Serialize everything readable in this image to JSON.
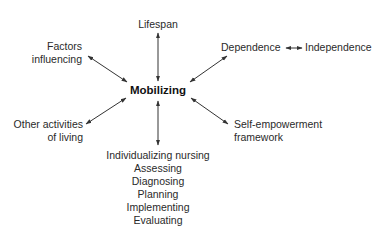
{
  "diagram": {
    "center": "Mobilizing",
    "nodes": {
      "top": "Lifespan",
      "top_left": [
        "Factors",
        "influencing"
      ],
      "top_right_a": "Dependence",
      "top_right_b": "Independence",
      "bottom_left": [
        "Other activities",
        "of living"
      ],
      "bottom_right": [
        "Self-empowerment",
        "framework"
      ],
      "bottom": [
        "Individualizing nursing",
        "Assessing",
        "Diagnosing",
        "Planning",
        "Implementing",
        "Evaluating"
      ]
    },
    "arrow_color": "#333333",
    "arrow_style": "double-headed"
  }
}
